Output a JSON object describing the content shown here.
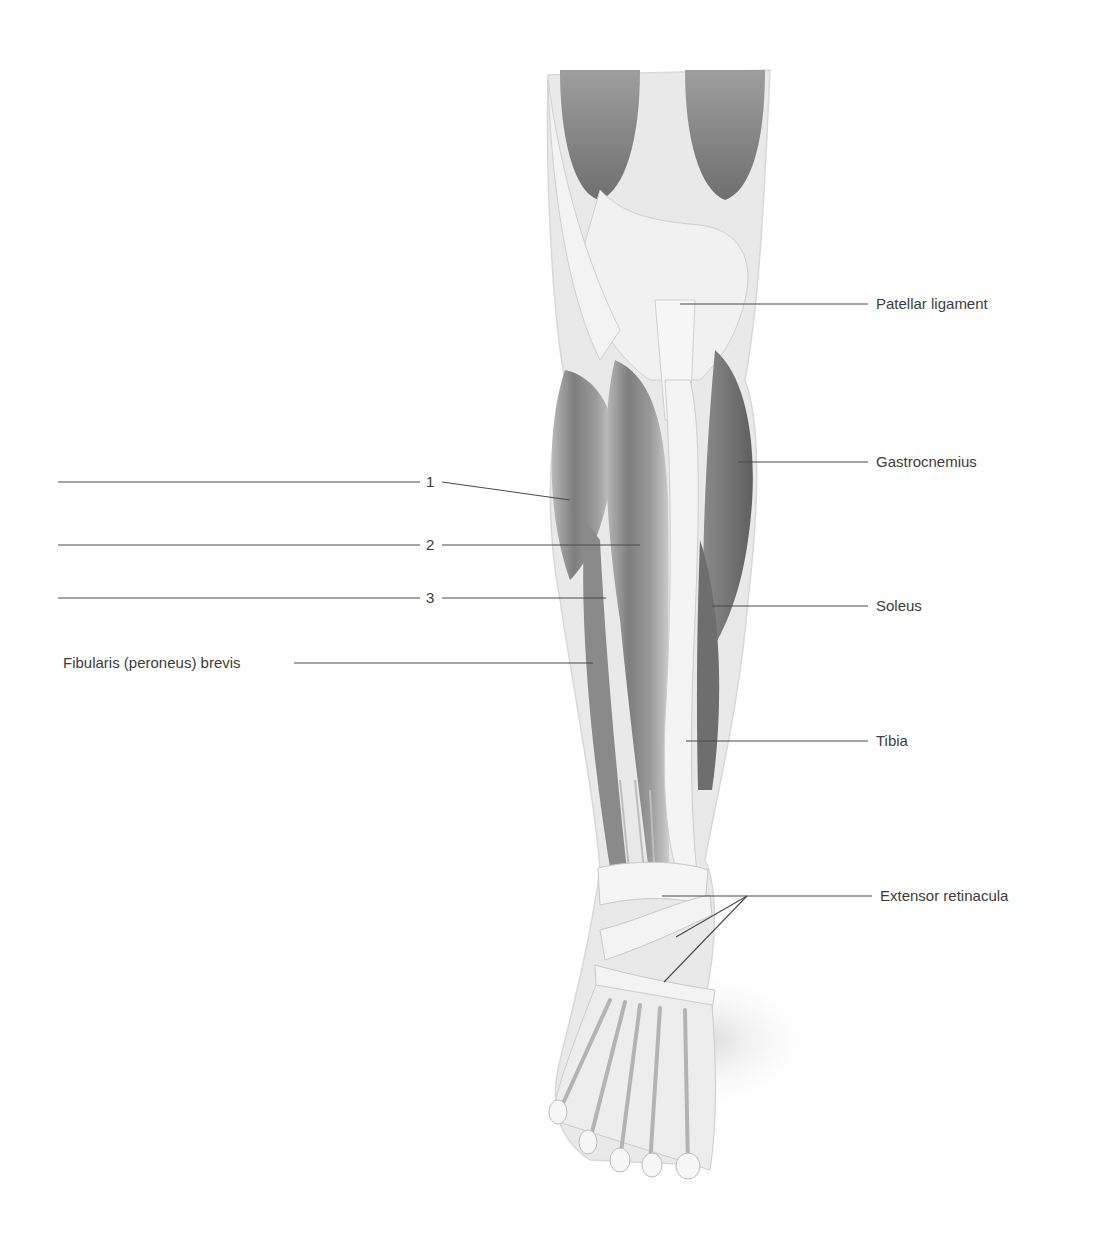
{
  "figure": {
    "labels_right": [
      {
        "id": "patellar-ligament",
        "text": "Patellar ligament",
        "x": 877,
        "y": 304,
        "line_from": [
          680,
          304
        ]
      },
      {
        "id": "gastrocnemius",
        "text": "Gastrocnemius",
        "x": 877,
        "y": 462,
        "line_from": [
          738,
          462
        ]
      },
      {
        "id": "soleus",
        "text": "Soleus",
        "x": 877,
        "y": 606,
        "line_from": [
          712,
          606
        ]
      },
      {
        "id": "tibia",
        "text": "Tibia",
        "x": 877,
        "y": 741,
        "line_from": [
          686,
          741
        ]
      },
      {
        "id": "extensor-retinacula",
        "text": "Extensor retinacula",
        "x": 881,
        "y": 896,
        "line_from": [
          747,
          896
        ]
      }
    ],
    "labels_left": [
      {
        "id": "label-1",
        "text": "1",
        "y": 482,
        "blank_from": 58,
        "blank_to": 424,
        "target": [
          570,
          500
        ]
      },
      {
        "id": "label-2",
        "text": "2",
        "y": 545,
        "blank_from": 58,
        "blank_to": 424,
        "target": [
          640,
          545
        ]
      },
      {
        "id": "label-3",
        "text": "3",
        "y": 598,
        "blank_from": 58,
        "blank_to": 424,
        "target": [
          606,
          598
        ]
      },
      {
        "id": "fibularis-brevis",
        "text": "Fibularis (peroneus) brevis",
        "x": 63,
        "y": 663,
        "line_from": 292,
        "target": [
          593,
          663
        ]
      }
    ],
    "retinacula_branches": [
      {
        "from": [
          747,
          896
        ],
        "to": [
          662,
          896
        ]
      },
      {
        "from": [
          747,
          896
        ],
        "to": [
          676,
          937
        ]
      },
      {
        "from": [
          747,
          896
        ],
        "to": [
          664,
          982
        ]
      }
    ]
  },
  "colors": {
    "text": "#3c3c3c",
    "leader_line": "#4a4a4a",
    "muscle_dark": "#7d7d7d",
    "muscle_mid": "#a8a8a8",
    "tendon_light": "#ececec",
    "background": "#ffffff"
  }
}
